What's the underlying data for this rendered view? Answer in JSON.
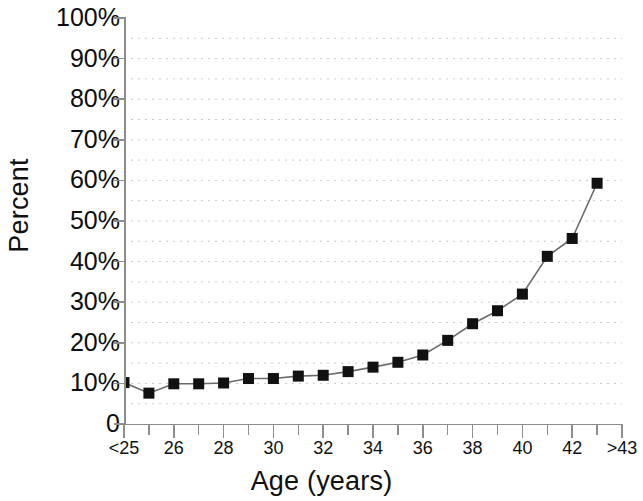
{
  "chart_data": {
    "type": "line",
    "title": "",
    "xlabel": "Age (years)",
    "ylabel": "Percent",
    "categories": [
      "<25",
      "26",
      "27",
      "28",
      "29",
      "30",
      "31",
      "32",
      "33",
      "34",
      "35",
      "36",
      "37",
      "38",
      "39",
      "40",
      "41",
      "42",
      "43",
      ">43"
    ],
    "x_tick_labels": [
      {
        "index": 0,
        "label": "<25"
      },
      {
        "index": 2,
        "label": "26"
      },
      {
        "index": 4,
        "label": "28"
      },
      {
        "index": 6,
        "label": "30"
      },
      {
        "index": 8,
        "label": "32"
      },
      {
        "index": 10,
        "label": "34"
      },
      {
        "index": 12,
        "label": "36"
      },
      {
        "index": 14,
        "label": "38"
      },
      {
        "index": 16,
        "label": "40"
      },
      {
        "index": 18,
        "label": "42"
      },
      {
        "index": 20,
        "label": ">43"
      }
    ],
    "values": [
      10.2,
      7.6,
      9.9,
      9.9,
      10.1,
      11.2,
      11.2,
      11.8,
      12.0,
      12.9,
      14.0,
      15.2,
      17.0,
      20.6,
      24.7,
      27.9,
      32.0,
      41.3,
      45.7,
      59.3
    ],
    "x_categories_full": [
      "<25",
      "25",
      "26",
      "27",
      "28",
      "29",
      "30",
      "31",
      "32",
      "33",
      "34",
      "35",
      "36",
      "37",
      "38",
      "39",
      "40",
      "41",
      "42",
      ">43"
    ],
    "ylim": [
      0,
      100
    ],
    "y_tick_labels": [
      "100%",
      "90%",
      "80%",
      "70%",
      "60%",
      "50%",
      "40%",
      "30%",
      "20%",
      "10%",
      "0"
    ],
    "y_tick_values": [
      100,
      90,
      80,
      70,
      60,
      50,
      40,
      30,
      20,
      10,
      0
    ],
    "grid": "horizontal-dotted-minor-5-percent",
    "gridline_values": [
      95,
      90,
      85,
      80,
      75,
      70,
      65,
      60,
      55,
      50,
      45,
      40,
      35,
      30,
      25,
      20,
      15,
      10,
      5
    ],
    "legend": "none",
    "marker": "square",
    "marker_color": "#111111",
    "line_color": "#6b6b6b",
    "grid_color": "#c9c9c9",
    "axis_color": "#8d8d8d",
    "background_color": "#ffffff"
  }
}
